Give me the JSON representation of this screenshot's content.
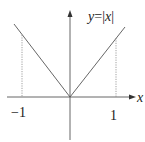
{
  "diagram": {
    "function_label": "y = |x|",
    "label_y": "y",
    "label_eq": "=",
    "label_abs": "|x|",
    "x_axis_label": "x",
    "tick_neg": "−1",
    "tick_pos": "1",
    "colors": {
      "line": "#555555",
      "axis": "#555555",
      "dotted": "#888888",
      "text": "#222222"
    }
  }
}
